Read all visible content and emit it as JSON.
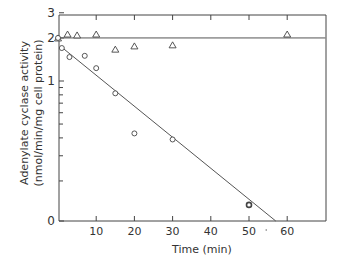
{
  "chart_data": {
    "type": "scatter",
    "title": "",
    "xlabel": "Time (min)",
    "ylabel": "Adenylate cyclase activity (nmol/min/mg cell protein)",
    "ylabel_line1": "Adenylate cyclase activity",
    "ylabel_line2": "(nmol/min/mg cell protein)",
    "xlim": [
      0,
      70
    ],
    "ylim": [
      0.1,
      3
    ],
    "yscale": "log",
    "x_ticks": [
      10,
      20,
      30,
      40,
      50,
      60
    ],
    "x_tick_labels": [
      "10",
      "20",
      "30",
      "40",
      "50",
      "60"
    ],
    "y_tick_labels": [
      {
        "value": 3,
        "label": "3"
      },
      {
        "value": 2,
        "label": "2"
      },
      {
        "value": 1,
        "label": "1"
      },
      {
        "value": 0.1,
        "label": "0"
      }
    ],
    "y_minor_ticks": [
      0.9,
      0.8,
      0.7,
      0.6,
      0.5,
      0.4,
      0.3,
      0.2
    ],
    "grid": false,
    "series": [
      {
        "name": "triangles (control)",
        "marker": "triangle",
        "x": [
          0,
          2.5,
          5,
          10,
          15,
          20,
          30,
          60
        ],
        "y": [
          2.0,
          2.13,
          2.1,
          2.13,
          1.67,
          1.76,
          1.79,
          2.13
        ],
        "fit_line": {
          "x": [
            0,
            70
          ],
          "y": [
            2.0,
            2.0
          ]
        }
      },
      {
        "name": "circles (decay)",
        "marker": "circle",
        "x": [
          0,
          1,
          3,
          7,
          10,
          15,
          20,
          30,
          50
        ],
        "y": [
          2.0,
          1.7,
          1.47,
          1.5,
          1.23,
          0.82,
          0.43,
          0.39,
          0.136
        ],
        "fit_line": {
          "x": [
            1,
            57
          ],
          "y": [
            1.72,
            0.1
          ]
        }
      }
    ]
  },
  "axis": {
    "x_title": "Time (min)",
    "y_title_line1": "Adenylate cyclase activity",
    "y_title_line2": "(nmol/min/mg cell protein)"
  }
}
